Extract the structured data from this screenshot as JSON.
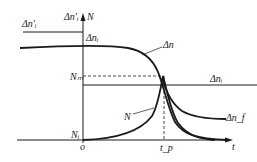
{
  "diagram": {
    "type": "laser pulse dynamics (Q-switching) plot",
    "axes": {
      "x_label": "t",
      "y_label": "N",
      "y_label_top_left": "Δn'ᵢ",
      "origin_label": "o"
    },
    "labels": {
      "delta_n_i_prime": "Δn'ᵢ",
      "delta_n_i_axis": "Δnᵢ",
      "delta_n": "Δn",
      "n_m": "Nₘ",
      "delta_n_i_right": "Δnᵢ",
      "n_curve": "N",
      "delta_n_f": "Δn_f",
      "n_i": "Nᵢ",
      "t_p": "t_p"
    },
    "curves": [
      {
        "name": "Δn",
        "description": "population inversion, flat then drops sharply near t_p to Δn_f"
      },
      {
        "name": "N",
        "description": "photon number, rises from Nᵢ to peak Nₘ at t_p then decays"
      },
      {
        "name": "Δn'ᵢ",
        "description": "initial inversion level line (left of axis)"
      },
      {
        "name": "Δnᵢ threshold",
        "description": "horizontal threshold line"
      }
    ],
    "colors": {
      "stroke": "#1a1a1a",
      "background": "#ffffff"
    }
  }
}
